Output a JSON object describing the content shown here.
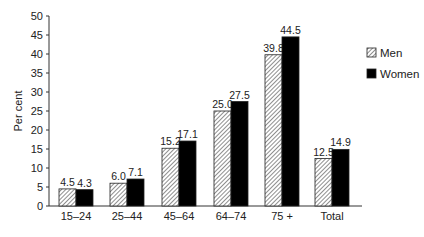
{
  "chart_data": {
    "type": "bar",
    "title": "",
    "xlabel": "",
    "ylabel": "Per cent",
    "ylim": [
      0,
      50
    ],
    "yticks": [
      0,
      5,
      10,
      15,
      20,
      25,
      30,
      35,
      40,
      45,
      50
    ],
    "grid": false,
    "legend_position": "right",
    "categories": [
      "15–24",
      "25–44",
      "45–64",
      "64–74",
      "75 +",
      "Total"
    ],
    "series": [
      {
        "name": "Men",
        "pattern": "hatched",
        "values": [
          4.5,
          6.0,
          15.2,
          25.0,
          39.8,
          12.5
        ],
        "labels": [
          "4.5",
          "6.0",
          "15.2",
          "25.0",
          "39.8",
          "12.5"
        ]
      },
      {
        "name": "Women",
        "pattern": "solid",
        "color": "#000000",
        "values": [
          4.3,
          7.1,
          17.1,
          27.5,
          44.5,
          14.9
        ],
        "labels": [
          "4.3",
          "7.1",
          "17.1",
          "27.5",
          "44.5",
          "14.9"
        ]
      }
    ]
  }
}
